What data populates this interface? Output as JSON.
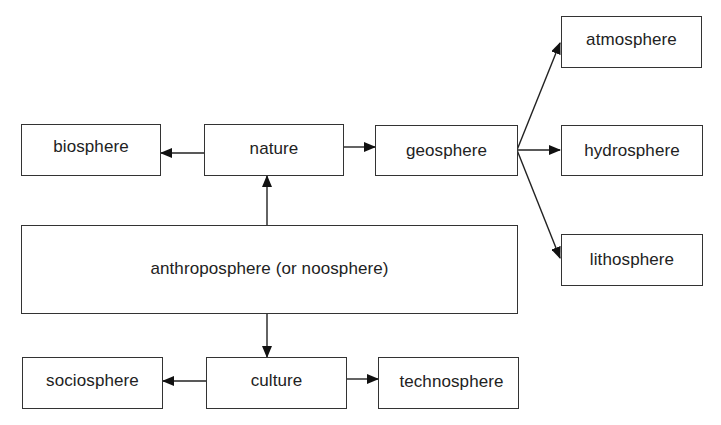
{
  "diagram": {
    "type": "hierarchy",
    "colors": {
      "background": "#ffffff",
      "stroke": "#333333",
      "text": "#222222"
    },
    "nodes": {
      "biosphere": {
        "label": "biosphere"
      },
      "nature": {
        "label": "nature"
      },
      "geosphere": {
        "label": "geosphere"
      },
      "atmosphere": {
        "label": "atmosphere"
      },
      "hydrosphere": {
        "label": "hydrosphere"
      },
      "lithosphere": {
        "label": "lithosphere"
      },
      "anthroposphere": {
        "label": "anthroposphere (or noosphere)"
      },
      "sociosphere": {
        "label": "sociosphere"
      },
      "culture": {
        "label": "culture"
      },
      "technosphere": {
        "label": "technosphere"
      }
    },
    "edges": [
      {
        "from": "anthroposphere",
        "to": "nature"
      },
      {
        "from": "nature",
        "to": "biosphere"
      },
      {
        "from": "nature",
        "to": "geosphere"
      },
      {
        "from": "geosphere",
        "to": "atmosphere"
      },
      {
        "from": "geosphere",
        "to": "hydrosphere"
      },
      {
        "from": "geosphere",
        "to": "lithosphere"
      },
      {
        "from": "anthroposphere",
        "to": "culture"
      },
      {
        "from": "culture",
        "to": "sociosphere"
      },
      {
        "from": "culture",
        "to": "technosphere"
      }
    ]
  }
}
